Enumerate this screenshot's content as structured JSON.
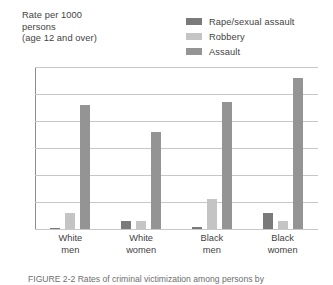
{
  "axis_title": "Rate per 1000\npersons\n(age 12 and over)",
  "legend": [
    {
      "label": "Rape/sexual assault",
      "color": "#7a7a7a"
    },
    {
      "label": "Robbery",
      "color": "#c4c4c4"
    },
    {
      "label": "Assault",
      "color": "#949494"
    }
  ],
  "caption": "FIGURE 2-2   Rates of criminal victimization among persons by",
  "chart_data": {
    "type": "bar",
    "title": "",
    "xlabel": "",
    "ylabel": "Rate per 1000 persons (age 12 and over)",
    "categories": [
      "White\nmen",
      "White\nwomen",
      "Black\nmen",
      "Black\nwomen"
    ],
    "series": [
      {
        "name": "Rape/sexual assault",
        "color": "#7a7a7a",
        "values": [
          0.2,
          1.5,
          0.4,
          3.0
        ]
      },
      {
        "name": "Robbery",
        "color": "#c4c4c4",
        "values": [
          3.0,
          1.5,
          5.5,
          1.5
        ]
      },
      {
        "name": "Assault",
        "color": "#949494",
        "values": [
          23.0,
          18.0,
          23.5,
          28.0
        ]
      }
    ],
    "yticks": [
      0,
      5,
      10,
      15,
      20,
      25,
      30
    ],
    "ylim": [
      0,
      30
    ],
    "grid": true,
    "legend_position": "top-right"
  }
}
